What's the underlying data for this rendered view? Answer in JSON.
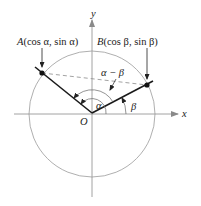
{
  "diagram": {
    "colors": {
      "circle": "#9a9a9a",
      "axes": "#8a8a8a",
      "rays": "#1a1a1a",
      "dashed": "#8a8a8a",
      "text": "#222222"
    },
    "axes": {
      "x_label": "x",
      "y_label": "y"
    },
    "origin_label": "O",
    "points": [
      {
        "id": "A",
        "name": "A",
        "coords_text": "(cos α, sin α)"
      },
      {
        "id": "B",
        "name": "B",
        "coords_text": "(cos β, sin β)"
      }
    ],
    "angles": {
      "alpha": "α",
      "beta": "β",
      "difference": "α − β"
    }
  }
}
